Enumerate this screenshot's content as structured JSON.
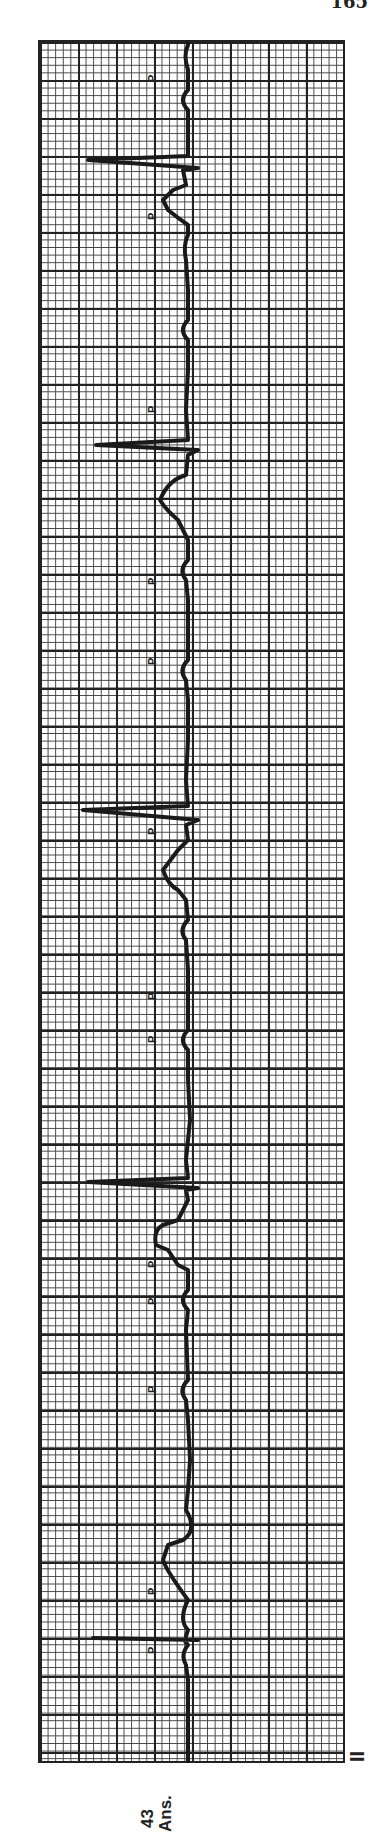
{
  "page": {
    "number": "165"
  },
  "strip": {
    "lead": "II",
    "age": "43",
    "age_unit": "Ans.",
    "orientation": "rotated 90° (time runs bottom to top)",
    "grid": {
      "small_box_px": 7.6,
      "large_box_px": 38
    },
    "p_wave_label": "P",
    "p_waves_marked": 13,
    "qrs_complexes_visible": 5
  }
}
